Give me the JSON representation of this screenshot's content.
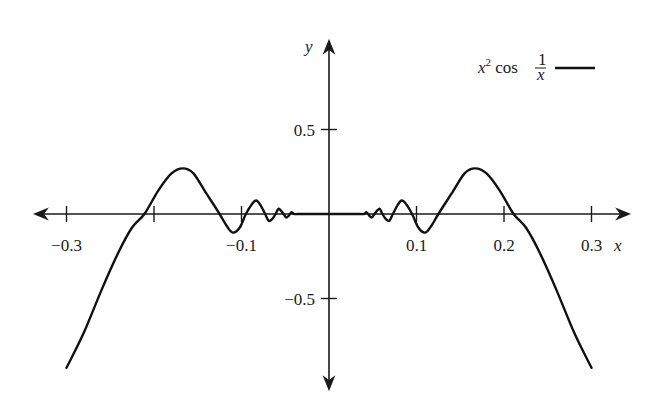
{
  "chart_data": {
    "type": "line",
    "title": "",
    "xlabel": "x",
    "ylabel": "y",
    "xlim": [
      -0.33,
      0.34
    ],
    "ylim": [
      -1.0,
      1.0
    ],
    "grid": false,
    "legend_position": "top-right",
    "legend": [
      {
        "label": "x² cos(1/x)",
        "style": "solid black line"
      }
    ],
    "x_ticks": [
      -0.3,
      -0.2,
      -0.1,
      0.1,
      0.2,
      0.3
    ],
    "x_tick_labels": [
      "−0.3",
      "",
      "−0.1",
      "0.1",
      "0.2",
      "0.3"
    ],
    "y_ticks": [
      0.5,
      -0.5
    ],
    "y_tick_labels": [
      "0.5",
      "−0.5"
    ],
    "series": [
      {
        "name": "x^2 cos(1/x)",
        "x": [
          -0.3,
          -0.28,
          -0.26,
          -0.24,
          -0.225,
          -0.211,
          -0.195,
          -0.18,
          -0.167,
          -0.155,
          -0.14,
          -0.125,
          -0.117,
          -0.11,
          -0.102,
          -0.095,
          -0.088,
          -0.083,
          -0.078,
          -0.073,
          -0.069,
          -0.065,
          -0.061,
          -0.058,
          -0.055,
          -0.052,
          -0.049,
          -0.046,
          -0.043,
          -0.04,
          -0.036,
          -0.03,
          0.0,
          0.03,
          0.036,
          0.04,
          0.043,
          0.046,
          0.049,
          0.052,
          0.055,
          0.058,
          0.061,
          0.065,
          0.069,
          0.073,
          0.078,
          0.083,
          0.088,
          0.095,
          0.102,
          0.11,
          0.117,
          0.125,
          0.14,
          0.155,
          0.167,
          0.18,
          0.195,
          0.211,
          0.225,
          0.24,
          0.26,
          0.28,
          0.3
        ],
        "y": [
          -0.91,
          -0.7,
          -0.45,
          -0.22,
          -0.08,
          0.0,
          0.14,
          0.24,
          0.27,
          0.24,
          0.12,
          0.0,
          -0.07,
          -0.11,
          -0.08,
          0.0,
          0.06,
          0.08,
          0.05,
          0.0,
          -0.04,
          -0.03,
          0.0,
          0.03,
          0.02,
          0.0,
          -0.02,
          -0.01,
          0.01,
          0.0,
          0.0,
          0.0,
          0.0,
          0.0,
          0.0,
          0.0,
          0.01,
          -0.01,
          -0.02,
          0.0,
          0.02,
          0.03,
          0.0,
          -0.03,
          -0.04,
          0.0,
          0.05,
          0.08,
          0.06,
          0.0,
          -0.08,
          -0.11,
          -0.07,
          0.0,
          0.12,
          0.24,
          0.27,
          0.24,
          0.14,
          0.0,
          -0.08,
          -0.22,
          -0.45,
          -0.7,
          -0.91
        ]
      }
    ]
  },
  "labels": {
    "x_axis": "x",
    "y_axis": "y",
    "legend_text": "x² cos ",
    "legend_frac_num": "1",
    "legend_frac_den": "x"
  }
}
